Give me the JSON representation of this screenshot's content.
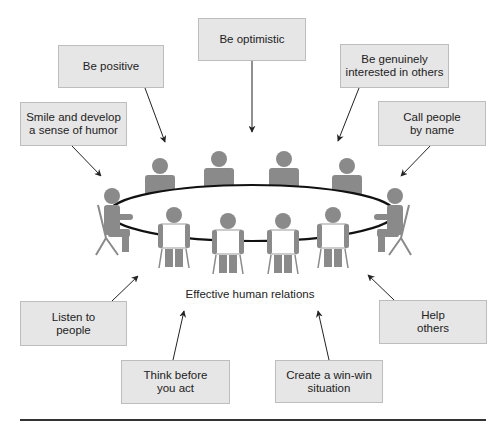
{
  "diagram": {
    "center_label": "Effective human relations",
    "boxes": [
      {
        "id": "be-positive",
        "lines": [
          "Be positive",
          ""
        ]
      },
      {
        "id": "be-optimistic",
        "lines": [
          "Be optimistic",
          ""
        ]
      },
      {
        "id": "be-genuinely-interested",
        "lines": [
          "Be genuinely",
          "interested in others"
        ]
      },
      {
        "id": "smile-humor",
        "lines": [
          "Smile and develop",
          "a sense of humor"
        ]
      },
      {
        "id": "call-by-name",
        "lines": [
          "Call people",
          "by name"
        ]
      },
      {
        "id": "listen",
        "lines": [
          "Listen to",
          "people"
        ]
      },
      {
        "id": "help-others",
        "lines": [
          "Help",
          "others"
        ]
      },
      {
        "id": "think-before",
        "lines": [
          "Think before",
          "you act"
        ]
      },
      {
        "id": "win-win",
        "lines": [
          "Create a win-win",
          "situation"
        ]
      }
    ],
    "colors": {
      "box_fill": "#e6e6e6",
      "box_border": "#bdbdbd",
      "figure": "#8a8a8a",
      "table_outline": "#111111",
      "arrow": "#222222"
    }
  }
}
